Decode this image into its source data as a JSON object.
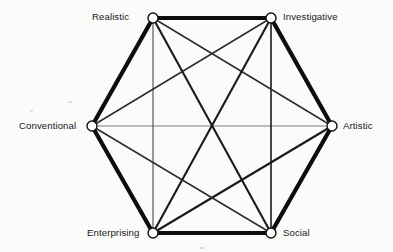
{
  "figure": {
    "name": "Holland RIASEC Hexagon",
    "background_color": "#fbfbfa",
    "line_color": "#111111",
    "node_fill": "#ffffff",
    "node_stroke": "#111111"
  },
  "nodes": [
    {
      "id": "realistic",
      "label": "Realistic",
      "x": 153,
      "y": 18,
      "label_anchor": "right"
    },
    {
      "id": "investigative",
      "label": "Investigative",
      "x": 271,
      "y": 18,
      "label_anchor": "left"
    },
    {
      "id": "artistic",
      "label": "Artistic",
      "x": 332,
      "y": 126,
      "label_anchor": "left"
    },
    {
      "id": "social",
      "label": "Social",
      "x": 271,
      "y": 233,
      "label_anchor": "left"
    },
    {
      "id": "enterprising",
      "label": "Enterprising",
      "x": 153,
      "y": 233,
      "label_anchor": "right"
    },
    {
      "id": "conventional",
      "label": "Conventional",
      "x": 92,
      "y": 126,
      "label_anchor": "right"
    }
  ],
  "chart_data": {
    "type": "diagram",
    "categories": [
      "Realistic",
      "Investigative",
      "Artistic",
      "Social",
      "Enterprising",
      "Conventional"
    ],
    "node_positions": {
      "Realistic": [
        153,
        18
      ],
      "Investigative": [
        271,
        18
      ],
      "Artistic": [
        332,
        126
      ],
      "Social": [
        271,
        233
      ],
      "Enterprising": [
        153,
        233
      ],
      "Conventional": [
        92,
        126
      ]
    },
    "edges": [
      {
        "from": "Realistic",
        "to": "Investigative",
        "relation": "adjacent",
        "weight": "thick",
        "stroke_width": 4.2,
        "color": "#0d0d0d"
      },
      {
        "from": "Investigative",
        "to": "Artistic",
        "relation": "adjacent",
        "weight": "thick",
        "stroke_width": 4.2,
        "color": "#0d0d0d"
      },
      {
        "from": "Artistic",
        "to": "Social",
        "relation": "adjacent",
        "weight": "thick",
        "stroke_width": 4.2,
        "color": "#0d0d0d"
      },
      {
        "from": "Social",
        "to": "Enterprising",
        "relation": "adjacent",
        "weight": "thick",
        "stroke_width": 4.2,
        "color": "#0d0d0d"
      },
      {
        "from": "Enterprising",
        "to": "Conventional",
        "relation": "adjacent",
        "weight": "thick",
        "stroke_width": 4.2,
        "color": "#0d0d0d"
      },
      {
        "from": "Conventional",
        "to": "Realistic",
        "relation": "adjacent",
        "weight": "thick",
        "stroke_width": 4.2,
        "color": "#0d0d0d"
      },
      {
        "from": "Realistic",
        "to": "Artistic",
        "relation": "alternate",
        "weight": "medium",
        "stroke_width": 1.5,
        "color": "#2b2b2b"
      },
      {
        "from": "Realistic",
        "to": "Social",
        "relation": "alternate",
        "weight": "medium",
        "stroke_width": 2.1,
        "color": "#1a1a1a"
      },
      {
        "from": "Investigative",
        "to": "Social",
        "relation": "alternate",
        "weight": "medium",
        "stroke_width": 1.5,
        "color": "#2b2b2b"
      },
      {
        "from": "Investigative",
        "to": "Enterprising",
        "relation": "alternate",
        "weight": "medium",
        "stroke_width": 2.1,
        "color": "#1a1a1a"
      },
      {
        "from": "Artistic",
        "to": "Enterprising",
        "relation": "alternate",
        "weight": "medium",
        "stroke_width": 2.1,
        "color": "#1a1a1a"
      },
      {
        "from": "Conventional",
        "to": "Social",
        "relation": "alternate",
        "weight": "medium",
        "stroke_width": 1.5,
        "color": "#2b2b2b"
      },
      {
        "from": "Conventional",
        "to": "Investigative",
        "relation": "alternate",
        "weight": "medium",
        "stroke_width": 1.5,
        "color": "#2b2b2b"
      },
      {
        "from": "Artistic",
        "to": "Conventional",
        "relation": "opposite",
        "weight": "thin",
        "stroke_width": 0.9,
        "color": "#6b6b6b"
      },
      {
        "from": "Realistic",
        "to": "Enterprising",
        "relation": "opposite",
        "weight": "thin",
        "stroke_width": 1.1,
        "color": "#4a4a4a"
      },
      {
        "from": "Investigative",
        "to": "Enterprising",
        "relation": "long-thin",
        "weight": "thin",
        "stroke_width": 0.9,
        "color": "#6b6b6b"
      },
      {
        "from": "Investigative",
        "to": "Social",
        "relation": "vertical",
        "weight": "thin",
        "stroke_width": 1.1,
        "color": "#4a4a4a"
      },
      {
        "from": "Realistic",
        "to": "Social",
        "relation": "long-thin",
        "weight": "thin",
        "stroke_width": 0.9,
        "color": "#6b6b6b"
      }
    ],
    "node_marker": {
      "shape": "circle",
      "radius": 5,
      "fill": "#ffffff",
      "stroke": "#111111",
      "stroke_width": 1.4
    },
    "grid": false,
    "legend": null,
    "xlabel": "",
    "ylabel": ""
  }
}
